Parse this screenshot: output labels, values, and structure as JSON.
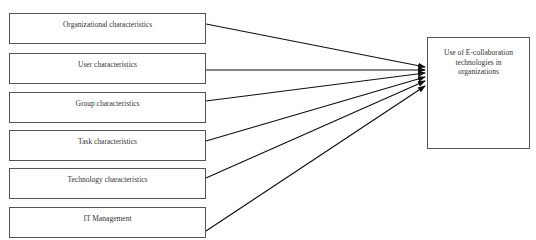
{
  "diagram": {
    "type": "influence-diagram",
    "sources": [
      {
        "label": "Organizational characteristics",
        "box": [
          9,
          13,
          197,
          31
        ],
        "arrow_from": [
          206,
          24
        ],
        "arrow_to": [
          425,
          67
        ]
      },
      {
        "label": "User characteristics",
        "box": [
          9,
          53,
          197,
          31
        ],
        "arrow_from": [
          206,
          70
        ],
        "arrow_to": [
          425,
          70
        ]
      },
      {
        "label": "Group characteristics",
        "box": [
          9,
          92,
          197,
          31
        ],
        "arrow_from": [
          206,
          101
        ],
        "arrow_to": [
          425,
          73
        ]
      },
      {
        "label": "Task characteristics",
        "box": [
          9,
          130,
          197,
          31
        ],
        "arrow_from": [
          206,
          141
        ],
        "arrow_to": [
          425,
          77
        ]
      },
      {
        "label": "Technology characteristics",
        "box": [
          9,
          168,
          197,
          31
        ],
        "arrow_from": [
          206,
          178
        ],
        "arrow_to": [
          425,
          81
        ]
      },
      {
        "label": "IT Management",
        "box": [
          9,
          207,
          197,
          31
        ],
        "arrow_from": [
          206,
          231
        ],
        "arrow_to": [
          425,
          86
        ]
      }
    ],
    "target": {
      "label": "Use of E-collaboration technologies in organizations",
      "box": [
        427,
        37,
        103,
        112
      ]
    },
    "colors": {
      "line": "#111111",
      "border": "#555555",
      "text": "#333333"
    }
  }
}
